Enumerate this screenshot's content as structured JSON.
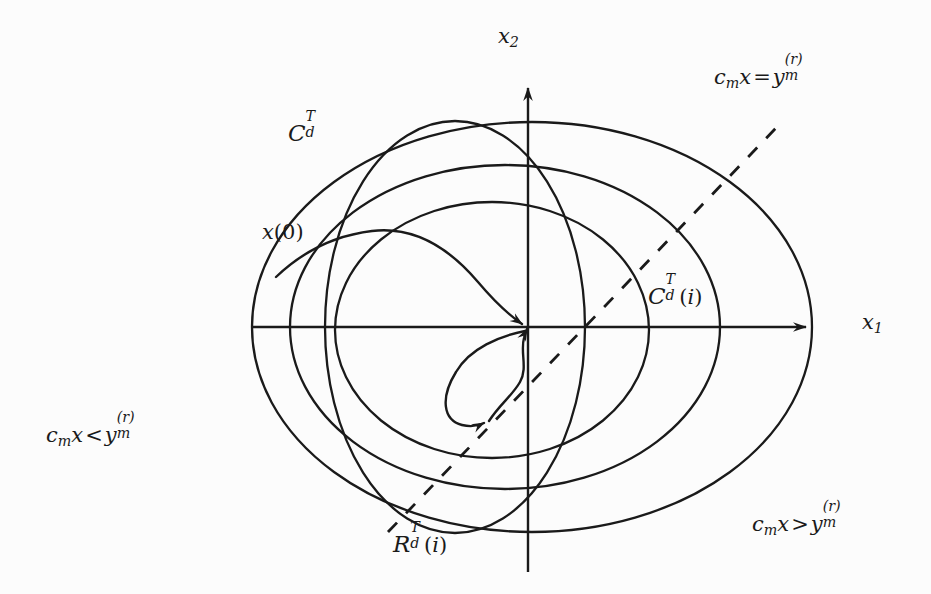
{
  "figure": {
    "type": "diagram",
    "background_color": "#fcfcfc",
    "stroke_color": "#1a1a1a",
    "axes": {
      "vertical_label": "x2",
      "horizontal_label": "x1",
      "origin_px": [
        528,
        327
      ],
      "x_axis_from_px": [
        252,
        327
      ],
      "x_axis_to_px": [
        812,
        327
      ],
      "y_axis_from_px": [
        528,
        572
      ],
      "y_axis_to_px": [
        528,
        81
      ],
      "arrowheads": [
        "x-positive",
        "y-positive"
      ]
    },
    "labels": {
      "x2": {
        "base": "x",
        "sub": "2"
      },
      "x1": {
        "base": "x",
        "sub": "1"
      },
      "outer_set": {
        "cal": "C",
        "sup": "T",
        "sub": "d"
      },
      "initial_state": {
        "text": "x(0)"
      },
      "controllable_set_i": {
        "cal": "C",
        "sup": "T",
        "sub": "d",
        "arg": "(i)"
      },
      "reachable_set_i": {
        "cal": "R",
        "sup": "T",
        "sub": "d",
        "arg": "(i)"
      },
      "hyperplane_eq": {
        "lhs_c": "c",
        "lhs_sub": "m",
        "lhs_x": "x",
        "op": "=",
        "rhs": "y",
        "rhs_sub": "m",
        "rhs_sup": "(r)"
      },
      "halfplane_less": {
        "lhs_c": "c",
        "lhs_sub": "m",
        "lhs_x": "x",
        "op": "<",
        "rhs": "y",
        "rhs_sub": "m",
        "rhs_sup": "(r)"
      },
      "halfplane_greater": {
        "lhs_c": "c",
        "lhs_sub": "m",
        "lhs_x": "x",
        "op": ">",
        "rhs": "y",
        "rhs_sub": "m",
        "rhs_sup": "(r)"
      }
    },
    "curves": [
      {
        "name": "outer-ellipse",
        "kind": "ellipse",
        "cx": 532,
        "cy": 327,
        "rx": 280,
        "ry": 205,
        "rotation_deg": 0,
        "dashed": false
      },
      {
        "name": "middle-ellipse",
        "kind": "ellipse",
        "cx": 505,
        "cy": 327,
        "rx": 215,
        "ry": 162,
        "rotation_deg": 0,
        "dashed": false
      },
      {
        "name": "inner-ellipse",
        "kind": "ellipse",
        "cx": 492,
        "cy": 330,
        "rx": 157,
        "ry": 128,
        "rotation_deg": 0,
        "dashed": false
      },
      {
        "name": "reachable-ellipse",
        "kind": "ellipse",
        "cx": 455,
        "cy": 327,
        "rx": 130,
        "ry": 206,
        "rotation_deg": 0,
        "dashed": false
      },
      {
        "name": "constraint-hyperplane",
        "kind": "line",
        "from": [
          388,
          532
        ],
        "to": [
          776,
          128
        ],
        "dashed": true,
        "dash_pattern": "13 13"
      }
    ],
    "trajectory": {
      "name": "state-trajectory",
      "start_px": [
        276,
        277
      ],
      "converges_to_px": [
        528,
        327
      ],
      "arrowheads": 3,
      "arrow_targets": [
        [
          528,
          327
        ],
        [
          528,
          327
        ],
        [
          487,
          421
        ]
      ]
    }
  }
}
